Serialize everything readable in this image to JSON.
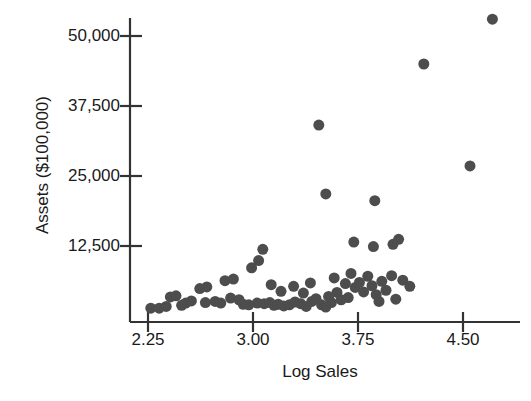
{
  "chart_data": {
    "type": "scatter",
    "title": "",
    "xlabel": "Log Sales",
    "ylabel": "Assets ($100,000)",
    "xlim": [
      2.15,
      4.8
    ],
    "ylim": [
      0,
      57000
    ],
    "xticks": [
      2.25,
      3.0,
      3.75,
      4.5
    ],
    "xtick_labels": [
      "2.25",
      "3.00",
      "3.75",
      "4.50"
    ],
    "yticks": [
      12500,
      25000,
      37500,
      50000
    ],
    "ytick_labels": [
      "12,500",
      "25,000",
      "37,500",
      "50,000"
    ],
    "grid": false,
    "legend": null,
    "marker": {
      "shape": "circle",
      "color": "#4d4d4d",
      "size_px": 11
    },
    "axis_color": "#333333",
    "background": "#ffffff",
    "points": [
      {
        "x": 2.27,
        "y": 1400
      },
      {
        "x": 2.33,
        "y": 1400
      },
      {
        "x": 2.41,
        "y": 3400
      },
      {
        "x": 2.45,
        "y": 3600
      },
      {
        "x": 2.52,
        "y": 2300
      },
      {
        "x": 2.56,
        "y": 2700
      },
      {
        "x": 2.62,
        "y": 4900
      },
      {
        "x": 2.67,
        "y": 5200
      },
      {
        "x": 2.66,
        "y": 2400
      },
      {
        "x": 2.73,
        "y": 2600
      },
      {
        "x": 2.8,
        "y": 6300
      },
      {
        "x": 2.86,
        "y": 6600
      },
      {
        "x": 2.84,
        "y": 3200
      },
      {
        "x": 2.9,
        "y": 2900
      },
      {
        "x": 2.93,
        "y": 2100
      },
      {
        "x": 2.97,
        "y": 2000
      },
      {
        "x": 2.99,
        "y": 8600
      },
      {
        "x": 3.04,
        "y": 9900
      },
      {
        "x": 3.07,
        "y": 11900
      },
      {
        "x": 3.03,
        "y": 2300
      },
      {
        "x": 3.08,
        "y": 2200
      },
      {
        "x": 3.12,
        "y": 2400
      },
      {
        "x": 3.15,
        "y": 1900
      },
      {
        "x": 3.18,
        "y": 2100
      },
      {
        "x": 3.13,
        "y": 5600
      },
      {
        "x": 3.22,
        "y": 1800
      },
      {
        "x": 3.26,
        "y": 2000
      },
      {
        "x": 3.3,
        "y": 2500
      },
      {
        "x": 3.34,
        "y": 2200
      },
      {
        "x": 3.29,
        "y": 5300
      },
      {
        "x": 3.38,
        "y": 1700
      },
      {
        "x": 3.42,
        "y": 2600
      },
      {
        "x": 3.45,
        "y": 3100
      },
      {
        "x": 3.41,
        "y": 5900
      },
      {
        "x": 3.49,
        "y": 2000
      },
      {
        "x": 3.52,
        "y": 1600
      },
      {
        "x": 3.56,
        "y": 2400
      },
      {
        "x": 3.6,
        "y": 4200
      },
      {
        "x": 3.58,
        "y": 6800
      },
      {
        "x": 3.63,
        "y": 2900
      },
      {
        "x": 3.66,
        "y": 5800
      },
      {
        "x": 3.7,
        "y": 7600
      },
      {
        "x": 3.68,
        "y": 3300
      },
      {
        "x": 3.73,
        "y": 5100
      },
      {
        "x": 3.76,
        "y": 6000
      },
      {
        "x": 3.79,
        "y": 4300
      },
      {
        "x": 3.82,
        "y": 7100
      },
      {
        "x": 3.85,
        "y": 5400
      },
      {
        "x": 3.88,
        "y": 3800
      },
      {
        "x": 3.92,
        "y": 6200
      },
      {
        "x": 3.95,
        "y": 4600
      },
      {
        "x": 3.72,
        "y": 13200
      },
      {
        "x": 3.86,
        "y": 12400
      },
      {
        "x": 4.0,
        "y": 12800
      },
      {
        "x": 4.04,
        "y": 13700
      },
      {
        "x": 3.99,
        "y": 7200
      },
      {
        "x": 4.07,
        "y": 6400
      },
      {
        "x": 3.47,
        "y": 34100
      },
      {
        "x": 3.52,
        "y": 21800
      },
      {
        "x": 3.87,
        "y": 20600
      },
      {
        "x": 4.22,
        "y": 45000
      },
      {
        "x": 4.55,
        "y": 26800
      },
      {
        "x": 4.71,
        "y": 53000
      },
      {
        "x": 4.12,
        "y": 5300
      },
      {
        "x": 2.38,
        "y": 1700
      },
      {
        "x": 2.49,
        "y": 1900
      },
      {
        "x": 2.77,
        "y": 2300
      },
      {
        "x": 3.2,
        "y": 4400
      },
      {
        "x": 3.36,
        "y": 4100
      },
      {
        "x": 3.54,
        "y": 3500
      },
      {
        "x": 3.9,
        "y": 2600
      },
      {
        "x": 4.02,
        "y": 3000
      }
    ]
  }
}
